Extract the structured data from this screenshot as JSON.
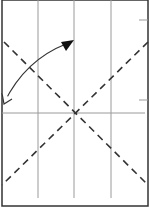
{
  "diagram": {
    "type": "origami-fold-instruction",
    "paper": {
      "x": 2,
      "y": 0,
      "width": 146,
      "height": 206,
      "stroke": "#333333"
    },
    "grid_lines": {
      "vertical_x": [
        38,
        74,
        111
      ],
      "horizontal_y": [
        113
      ],
      "color": "#9a9a9a"
    },
    "edge_ticks": [
      {
        "x1": 139,
        "y1": 20,
        "x2": 148,
        "y2": 20
      },
      {
        "x1": 139,
        "y1": 100,
        "x2": 148,
        "y2": 100
      }
    ],
    "fold_lines": [
      {
        "kind": "valley",
        "x1": 4,
        "y1": 42,
        "x2": 148,
        "y2": 185
      },
      {
        "kind": "valley",
        "x1": 148,
        "y1": 42,
        "x2": 2,
        "y2": 185
      }
    ],
    "arrow": {
      "description": "curved fold arrow from lower-left edge toward top center",
      "start": [
        3,
        103
      ],
      "control": [
        25,
        60
      ],
      "end": [
        72,
        40
      ],
      "head_end": "filled",
      "head_start": "open"
    },
    "colors": {
      "line": "#333333",
      "grid": "#9a9a9a",
      "background": "#ffffff"
    }
  }
}
